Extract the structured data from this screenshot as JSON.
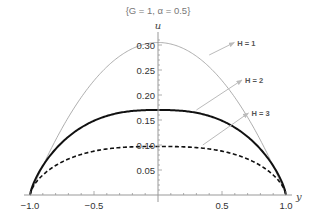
{
  "chart_data": {
    "type": "line",
    "title": "{G = 1, α = 0.5}",
    "title_parts": {
      "open": "{G = 1, ",
      "alpha": "α",
      "close": " = 0.5}"
    },
    "xlabel": "y",
    "ylabel": "u",
    "xlim": [
      -1.0,
      1.0
    ],
    "ylim": [
      0,
      0.31
    ],
    "grid": false,
    "legend": "none (inline arrow annotations)",
    "x_ticks": [
      -1.0,
      -0.5,
      0.5,
      1.0
    ],
    "x_tick_labels": [
      "−1.0",
      "−0.5",
      "0.5",
      "1.0"
    ],
    "y_ticks": [
      0.05,
      0.1,
      0.15,
      0.2,
      0.25,
      0.3
    ],
    "y_tick_labels": [
      "0.05",
      "0.10",
      "0.15",
      "0.20",
      "0.25",
      "0.30"
    ],
    "series": [
      {
        "name": "H = 1",
        "style": "thin solid gray",
        "peak": 0.305,
        "x": [
          -1.0,
          -0.75,
          -0.5,
          -0.25,
          0.0,
          0.25,
          0.5,
          0.75,
          1.0
        ],
        "values": [
          0.0,
          0.134,
          0.229,
          0.286,
          0.305,
          0.286,
          0.229,
          0.134,
          0.0
        ]
      },
      {
        "name": "H = 2",
        "style": "thick solid black",
        "peak": 0.17,
        "x": [
          -1.0,
          -0.75,
          -0.5,
          -0.25,
          0.0,
          0.25,
          0.5,
          0.75,
          1.0
        ],
        "values": [
          0.0,
          0.105,
          0.148,
          0.166,
          0.17,
          0.166,
          0.148,
          0.105,
          0.0
        ]
      },
      {
        "name": "H = 3",
        "style": "thick dashed black",
        "peak": 0.097,
        "x": [
          -1.0,
          -0.75,
          -0.5,
          -0.25,
          0.0,
          0.25,
          0.5,
          0.75,
          1.0
        ],
        "values": [
          0.0,
          0.066,
          0.087,
          0.095,
          0.097,
          0.095,
          0.087,
          0.066,
          0.0
        ]
      }
    ],
    "annotations": [
      {
        "text": "H = 1",
        "arrow_from": [
          0.4,
          0.28
        ],
        "label_at": [
          0.62,
          0.305
        ]
      },
      {
        "text": "H = 2",
        "arrow_from": [
          0.3,
          0.17
        ],
        "label_at": [
          0.68,
          0.23
        ]
      },
      {
        "text": "H = 3",
        "arrow_from": [
          0.35,
          0.1
        ],
        "label_at": [
          0.73,
          0.164
        ]
      }
    ]
  }
}
